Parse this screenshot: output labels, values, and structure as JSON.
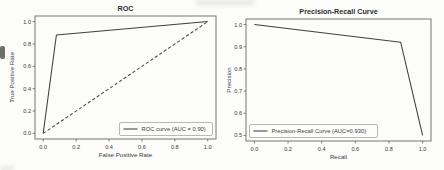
{
  "figure": {
    "background": "#fcfcfa",
    "spine_color": "#565656",
    "text_color": "#3b3b3b",
    "title_color": "#2e2e2e",
    "line_color": "#3f3f3f",
    "dashed_line_color": "#4a4a4a",
    "legend_border_color": "#9a9a96",
    "legend_fill": "#fdfdfc"
  },
  "chart_data": [
    {
      "type": "line",
      "title": "ROC",
      "xlabel": "False Positive Rate",
      "ylabel": "True Positive Rate",
      "xlim": [
        0.0,
        1.0
      ],
      "ylim": [
        0.0,
        1.0
      ],
      "xticks": [
        0.0,
        0.2,
        0.4,
        0.6,
        0.8,
        1.0
      ],
      "yticks": [
        0.0,
        0.2,
        0.4,
        0.6,
        0.8,
        1.0
      ],
      "grid": false,
      "legend_position": "lower-right",
      "series": [
        {
          "name": "ROC curve (AUC = 0.90)",
          "auc": 0.9,
          "style": "solid",
          "in_legend": true,
          "x": [
            0.0,
            0.08,
            1.0
          ],
          "y": [
            0.0,
            0.88,
            1.0
          ]
        },
        {
          "name": "chance-diagonal",
          "style": "dashed",
          "in_legend": false,
          "x": [
            0.0,
            1.0
          ],
          "y": [
            0.0,
            1.0
          ]
        }
      ]
    },
    {
      "type": "line",
      "title": "Precision-Recall Curve",
      "xlabel": "Recall",
      "ylabel": "Precision",
      "xlim": [
        0.0,
        1.0
      ],
      "ylim": [
        0.5,
        1.0
      ],
      "xticks": [
        0.0,
        0.2,
        0.4,
        0.6,
        0.8,
        1.0
      ],
      "yticks": [
        0.5,
        0.6,
        0.7,
        0.8,
        0.9,
        1.0
      ],
      "grid": false,
      "legend_position": "lower-left",
      "series": [
        {
          "name": "Precision-Recall Curve (AUC=0.930)",
          "auc": 0.93,
          "style": "solid",
          "in_legend": true,
          "x": [
            0.0,
            0.87,
            1.0
          ],
          "y": [
            1.0,
            0.92,
            0.5
          ]
        }
      ]
    }
  ]
}
